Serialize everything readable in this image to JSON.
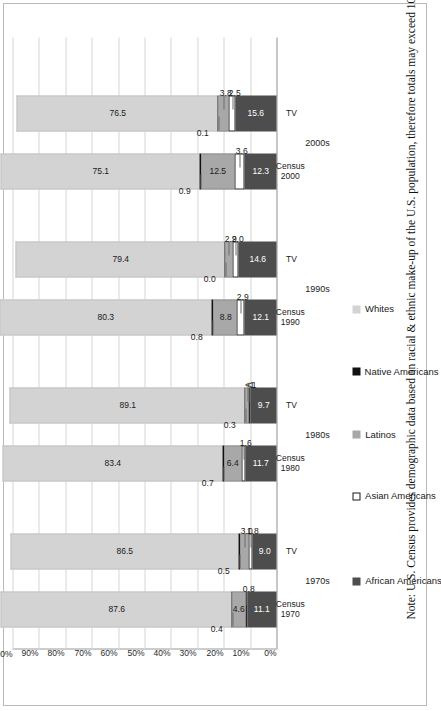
{
  "figure": {
    "note": "Note: U.S. Census provides demographic data based on racial & ethnic make-up of the U.S. population, therefore totals may exceed 100%.",
    "orientation": "rotated-90-ccw"
  },
  "legend": {
    "position": "bottom-left",
    "items": [
      {
        "label": "African Americans",
        "color": "#4d4d4d",
        "icon": "square-swatch-icon"
      },
      {
        "label": "Asian Americans",
        "color": "#ffffff",
        "icon": "square-swatch-icon"
      },
      {
        "label": "Latinos",
        "color": "#a8a8a8",
        "icon": "square-swatch-icon"
      },
      {
        "label": "Native Americans",
        "color": "#111111",
        "icon": "square-swatch-icon"
      },
      {
        "label": "Whites",
        "color": "#d3d3d3",
        "icon": "square-swatch-icon"
      }
    ]
  },
  "axis": {
    "ticks": [
      "0%",
      "10%",
      "20%",
      "30%",
      "40%",
      "50%",
      "60%",
      "70%",
      "80%",
      "90%",
      "100%"
    ]
  },
  "groups": [
    {
      "label": "1970s"
    },
    {
      "label": "1980s"
    },
    {
      "label": "1990s"
    },
    {
      "label": "2000s"
    }
  ],
  "categories": [
    {
      "line1": "Census",
      "line2": "1970"
    },
    {
      "line1": "TV",
      "line2": ""
    },
    {
      "line1": "Census",
      "line2": "1980"
    },
    {
      "line1": "TV",
      "line2": ""
    },
    {
      "line1": "Census",
      "line2": "1990"
    },
    {
      "line1": "TV",
      "line2": ""
    },
    {
      "line1": "Census",
      "line2": "2000"
    },
    {
      "line1": "TV",
      "line2": ""
    }
  ],
  "chart_data": {
    "type": "bar",
    "subtype": "stacked-horizontal-100pct",
    "title": "",
    "subtitle": "",
    "xlabel": "",
    "ylabel": "",
    "ylim": [
      0,
      100
    ],
    "grid": true,
    "legend_position": "bottom-left",
    "tick_labels": [
      "0%",
      "10%",
      "20%",
      "30%",
      "40%",
      "50%",
      "60%",
      "70%",
      "80%",
      "90%",
      "100%"
    ],
    "categories": [
      "Census 1970",
      "TV 1970s",
      "Census 1980",
      "TV 1980s",
      "Census 1990",
      "TV 1990s",
      "Census 2000",
      "TV 2000s"
    ],
    "groups": [
      "1970s",
      "1980s",
      "1990s",
      "2000s"
    ],
    "stack_order_from_zero": [
      "African Americans",
      "Asian Americans",
      "Latinos",
      "Native Americans",
      "Whites"
    ],
    "series": [
      {
        "name": "African Americans",
        "color": "#4d4d4d",
        "values": [
          11.1,
          9.0,
          11.7,
          9.7,
          12.1,
          14.6,
          12.3,
          15.6
        ],
        "labels": [
          "11.1",
          "9.0",
          "11.7",
          "9.7",
          "12.1",
          "14.6",
          "12.3",
          "15.6"
        ]
      },
      {
        "name": "Asian Americans",
        "color": "#ffffff",
        "values": [
          0.8,
          1.8,
          1.6,
          0.9,
          2.9,
          2.0,
          3.6,
          2.5
        ],
        "labels": [
          "0.8",
          "1.8",
          "1.6",
          "<1",
          "2.9",
          "2.0",
          "3.6",
          "2.5"
        ]
      },
      {
        "name": "Latinos",
        "color": "#a8a8a8",
        "values": [
          4.6,
          3.0,
          6.4,
          1.0,
          8.8,
          2.9,
          12.5,
          3.8
        ],
        "labels": [
          "4.6",
          "3.0",
          "6.4",
          "<1",
          "8.8",
          "2.9",
          "12.5",
          "3.8"
        ]
      },
      {
        "name": "Native Americans",
        "color": "#111111",
        "values": [
          0.4,
          0.5,
          0.7,
          0.3,
          0.8,
          0.0,
          0.9,
          0.1
        ],
        "labels": [
          "0.4",
          "0.5",
          "0.7",
          "0.3",
          "0.8",
          "0.0",
          "0.9",
          "0.1"
        ]
      },
      {
        "name": "Whites",
        "color": "#d3d3d3",
        "values": [
          87.6,
          86.5,
          83.4,
          89.1,
          80.3,
          79.4,
          75.1,
          76.5
        ],
        "labels": [
          "87.6",
          "86.5",
          "83.4",
          "89.1",
          "80.3",
          "79.4",
          "75.1",
          "76.5"
        ]
      }
    ],
    "annotations": [
      "Note: U.S. Census provides demographic data based on racial & ethnic make-up of the U.S. population, therefore totals may exceed 100%."
    ]
  }
}
